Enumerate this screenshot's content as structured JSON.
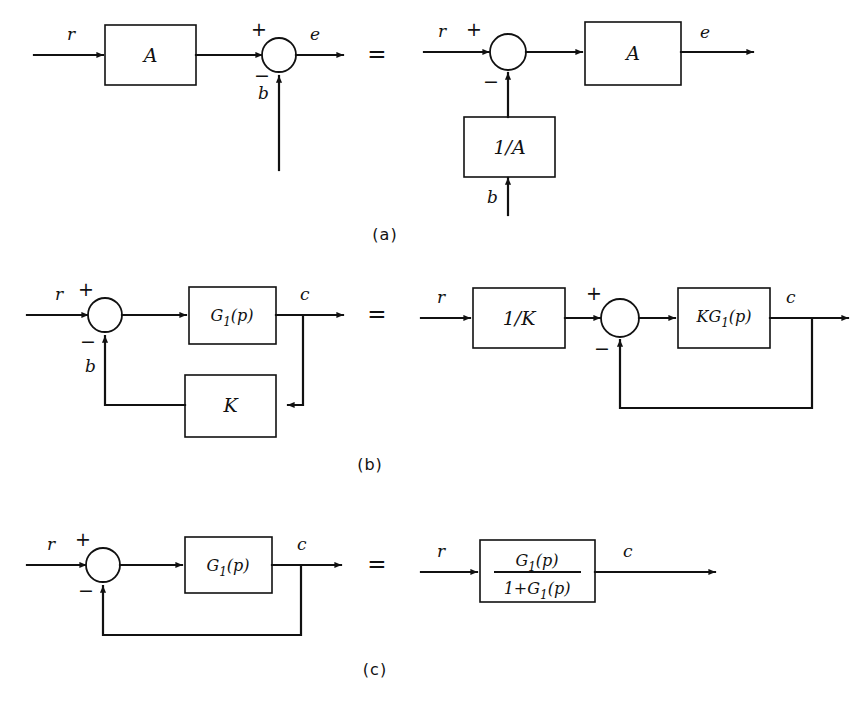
{
  "figure": {
    "background_color": "#ffffff",
    "ink_color": "#111111",
    "equals_symbol": "=",
    "plus_symbol": "+",
    "minus_symbol": "−",
    "rows": [
      {
        "caption": "(a)",
        "left": {
          "input_label": "r",
          "block_label": "A",
          "sum_plus": "+",
          "sum_minus": "−",
          "feedback_label": "b",
          "output_label": "e"
        },
        "right": {
          "input_label": "r",
          "sum_plus": "+",
          "sum_minus": "−",
          "block_label": "A",
          "feedback_block_label": "1/A",
          "feedback_input_label": "b",
          "output_label": "e"
        }
      },
      {
        "caption": "(b)",
        "left": {
          "input_label": "r",
          "sum_plus": "+",
          "sum_minus": "−",
          "feedback_label": "b",
          "forward_block_base": "G",
          "forward_block_sub": "1",
          "forward_block_arg": "(p)",
          "feedback_block_label": "K",
          "output_label": "c"
        },
        "right": {
          "input_label": "r",
          "pre_block_label": "1/K",
          "sum_plus": "+",
          "sum_minus": "−",
          "forward_block_prefix": "KG",
          "forward_block_sub": "1",
          "forward_block_arg": "(p)",
          "output_label": "c"
        }
      },
      {
        "caption": "(c)",
        "left": {
          "input_label": "r",
          "sum_plus": "+",
          "sum_minus": "−",
          "forward_block_base": "G",
          "forward_block_sub": "1",
          "forward_block_arg": "(p)",
          "output_label": "c"
        },
        "right": {
          "input_label": "r",
          "numerator_base": "G",
          "numerator_sub": "1",
          "numerator_arg": "(p)",
          "denominator_prefix": "1+G",
          "denominator_sub": "1",
          "denominator_arg": "(p)",
          "output_label": "c"
        }
      }
    ]
  }
}
